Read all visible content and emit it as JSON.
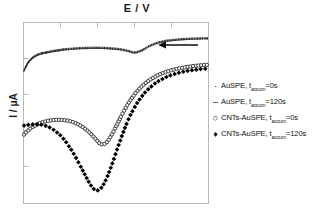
{
  "chart_data": {
    "type": "line",
    "title": "E / V",
    "xlabel": "E / V",
    "ylabel": "I / μA",
    "grid": false,
    "legend_position": "right",
    "annotations": [
      {
        "name": "scan-direction-arrow",
        "symbol": "←",
        "meaning": "scan direction (toward negative potential)"
      }
    ],
    "axes": {
      "x_ticks_visible": true,
      "y_ticks_visible": true,
      "x_tick_labels": [],
      "y_tick_labels": [],
      "frame": "box"
    },
    "series": [
      {
        "name": "AuSPE, t_accum=0s",
        "marker": "tiny-dot",
        "color": "#3a3a3a",
        "x": [
          0,
          2,
          4,
          6,
          8,
          10,
          12,
          14,
          16,
          18,
          20,
          22,
          25,
          28,
          31,
          34,
          37,
          40,
          44,
          48,
          52,
          56,
          60,
          64,
          68,
          72,
          76,
          80,
          84,
          88,
          92,
          96,
          100
        ],
        "y": [
          26,
          22,
          19.5,
          18,
          17,
          16.4,
          16,
          15.6,
          15.2,
          14.9,
          14.6,
          14.3,
          14.0,
          13.8,
          13.6,
          13.5,
          13.4,
          13.4,
          13.5,
          13.8,
          14.2,
          15.0,
          16.0,
          14.8,
          12.5,
          10.8,
          9.8,
          9.2,
          8.8,
          8.5,
          8.3,
          8.2,
          8.1
        ]
      },
      {
        "name": "AuSPE, t_accum=120s",
        "marker": "tiny-dash",
        "color": "#222222",
        "x": [
          0,
          2,
          4,
          6,
          8,
          10,
          12,
          14,
          16,
          18,
          20,
          22,
          25,
          28,
          31,
          34,
          37,
          40,
          44,
          48,
          52,
          56,
          60,
          64,
          68,
          72,
          76,
          80,
          84,
          88,
          92,
          96,
          100
        ],
        "y": [
          26.6,
          22.6,
          20.1,
          18.6,
          17.6,
          17.0,
          16.6,
          16.2,
          15.8,
          15.5,
          15.2,
          14.9,
          14.6,
          14.4,
          14.2,
          14.1,
          14.0,
          14.0,
          14.1,
          14.4,
          14.8,
          15.6,
          16.6,
          15.4,
          13.1,
          11.4,
          10.4,
          9.8,
          9.4,
          9.1,
          8.9,
          8.8,
          8.7
        ]
      },
      {
        "name": "CNTs-AuSPE, t_accum=0s",
        "marker": "open-circle",
        "color": "#2a2a2a",
        "x": [
          0,
          3,
          6,
          9,
          12,
          15,
          18,
          21,
          24,
          27,
          30,
          33,
          36,
          39,
          42,
          45,
          48,
          51,
          54,
          57,
          60,
          63,
          66,
          69,
          72,
          75,
          78,
          81,
          84,
          87,
          90,
          93,
          96,
          100
        ],
        "y": [
          62,
          59,
          57,
          55.5,
          54.6,
          54.0,
          53.8,
          53.9,
          54.3,
          55.2,
          56.6,
          58.6,
          61.2,
          64.5,
          67.4,
          66.2,
          61.5,
          55.5,
          49.5,
          44.2,
          39.8,
          36.2,
          33.4,
          31.2,
          29.4,
          28.0,
          26.9,
          26.0,
          25.3,
          24.7,
          24.2,
          23.8,
          23.5,
          23.2
        ]
      },
      {
        "name": "CNTs-AuSPE, t_accum=120s",
        "marker": "filled-diamond",
        "color": "#000000",
        "x": [
          0,
          3,
          6,
          9,
          12,
          15,
          18,
          21,
          24,
          27,
          30,
          33,
          36,
          39,
          42,
          45,
          48,
          51,
          54,
          57,
          60,
          63,
          66,
          69,
          72,
          75,
          78,
          81,
          84,
          87,
          90,
          93,
          96,
          100
        ],
        "y": [
          57,
          56.5,
          56.3,
          56.5,
          57.2,
          58.6,
          60.8,
          63.8,
          67.8,
          72.6,
          78.2,
          84.0,
          89.6,
          93.0,
          91.5,
          86.0,
          78.0,
          69.0,
          60.5,
          53.0,
          47.0,
          42.2,
          38.4,
          35.4,
          33.0,
          31.2,
          29.7,
          28.6,
          27.7,
          27.0,
          26.4,
          26.0,
          25.6,
          25.3
        ]
      }
    ]
  },
  "legend": {
    "entries": [
      {
        "marker_symbol": "·",
        "marker_name": "tiny-dot-marker",
        "text_prefix": "AuSPE, t",
        "sub": "accum",
        "text_suffix": "=0s"
      },
      {
        "marker_symbol": "–",
        "marker_name": "dash-marker",
        "text_prefix": "AuSPE, t",
        "sub": "accum",
        "text_suffix": "=120s"
      },
      {
        "marker_symbol": "○",
        "marker_name": "open-circle-marker",
        "text_prefix": "CNTs-AuSPE, t",
        "sub": "accum",
        "text_suffix": "=0s"
      },
      {
        "marker_symbol": "♦",
        "marker_name": "filled-diamond-marker",
        "text_prefix": "CNTs-AuSPE, t",
        "sub": "accum",
        "text_suffix": "=120s"
      }
    ]
  },
  "colors": {
    "frame": "#b8b8b8",
    "text": "#111111",
    "background": "#ffffff"
  }
}
